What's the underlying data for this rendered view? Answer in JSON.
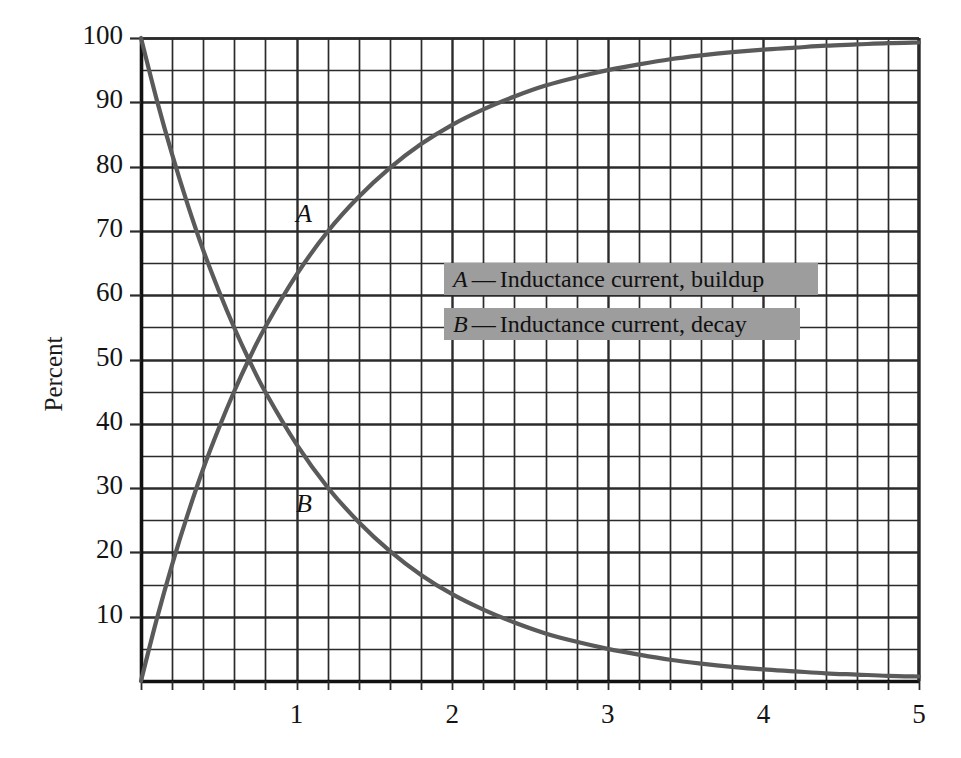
{
  "chart_data": {
    "type": "line",
    "title": "",
    "xlabel": "",
    "ylabel": "Percent",
    "xlim": [
      0,
      5
    ],
    "ylim": [
      0,
      100
    ],
    "grid": true,
    "x_major_ticks": [
      1,
      2,
      3,
      4,
      5
    ],
    "x_tick_labels": [
      "1",
      "2",
      "3",
      "4",
      "5"
    ],
    "x_minor_step": 0.2,
    "y_major_ticks": [
      10,
      20,
      30,
      40,
      50,
      60,
      70,
      80,
      90,
      100
    ],
    "y_tick_labels": [
      "10",
      "20",
      "30",
      "40",
      "50",
      "60",
      "70",
      "80",
      "90",
      "100"
    ],
    "y_minor_step": 5,
    "legend_position": "center-right",
    "series": [
      {
        "name": "A",
        "key": "A",
        "label": "Inductance current, buildup",
        "color": "#5a5a5a",
        "formula": "100 * (1 - exp(-t))",
        "inline_label": "A",
        "x": [
          0,
          0.1,
          0.2,
          0.3,
          0.4,
          0.5,
          0.6,
          0.693,
          0.8,
          1.0,
          1.2,
          1.4,
          1.6,
          1.8,
          2.0,
          2.2,
          2.4,
          2.6,
          2.8,
          3.0,
          3.2,
          3.4,
          3.6,
          3.8,
          4.0,
          4.2,
          4.4,
          4.6,
          4.8,
          5.0
        ],
        "values": [
          0,
          9.5,
          18.1,
          25.9,
          33.0,
          39.3,
          45.1,
          50.0,
          55.1,
          63.2,
          69.9,
          75.3,
          79.8,
          83.5,
          86.5,
          88.9,
          90.9,
          92.6,
          93.9,
          95.0,
          95.9,
          96.7,
          97.3,
          97.8,
          98.2,
          98.5,
          98.8,
          99.0,
          99.2,
          99.3
        ]
      },
      {
        "name": "B",
        "key": "B",
        "label": "Inductance current, decay",
        "color": "#5a5a5a",
        "formula": "100 * exp(-t)",
        "inline_label": "B",
        "x": [
          0,
          0.1,
          0.2,
          0.3,
          0.4,
          0.5,
          0.6,
          0.693,
          0.8,
          1.0,
          1.2,
          1.4,
          1.6,
          1.8,
          2.0,
          2.2,
          2.4,
          2.6,
          2.8,
          3.0,
          3.2,
          3.4,
          3.6,
          3.8,
          4.0,
          4.2,
          4.4,
          4.6,
          4.8,
          5.0
        ],
        "values": [
          100,
          90.5,
          81.9,
          74.1,
          67.0,
          60.7,
          54.9,
          50.0,
          44.9,
          36.8,
          30.1,
          24.7,
          20.2,
          16.5,
          13.5,
          11.1,
          9.1,
          7.4,
          6.1,
          5.0,
          4.1,
          3.3,
          2.7,
          2.2,
          1.8,
          1.5,
          1.2,
          1.0,
          0.8,
          0.7
        ]
      }
    ]
  },
  "legend": {
    "entries": [
      {
        "key": "A",
        "dash": "—",
        "label": "Inductance current, buildup"
      },
      {
        "key": "B",
        "dash": "—",
        "label": "Inductance current, decay"
      }
    ]
  },
  "colors": {
    "curve": "#5a5a5a",
    "grid": "#2b2b2b",
    "axis": "#111111",
    "legend_background": "#9d9d9d",
    "text": "#141414",
    "page_background": "#ffffff"
  }
}
